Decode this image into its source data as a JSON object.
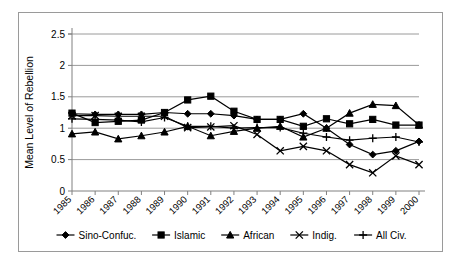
{
  "chart_data": {
    "type": "line",
    "title": "",
    "xlabel": "",
    "ylabel": "Mean Level of Rebellion",
    "ylim": [
      0,
      2.5
    ],
    "yticks": [
      0,
      0.5,
      1,
      1.5,
      2,
      2.5
    ],
    "ytick_labels": [
      "0",
      "0.5",
      "1",
      "1.5",
      "2",
      "2.5"
    ],
    "grid": "horizontal",
    "legend_position": "bottom",
    "categories": [
      "1985",
      "1986",
      "1987",
      "1988",
      "1989",
      "1990",
      "1991",
      "1992",
      "1993",
      "1994",
      "1995",
      "1996",
      "1997",
      "1998",
      "1999",
      "2000"
    ],
    "series": [
      {
        "name": "Sino-Confuc.",
        "marker": "diamond",
        "values": [
          1.23,
          1.22,
          1.22,
          1.22,
          1.25,
          1.23,
          1.23,
          1.2,
          1.14,
          1.14,
          1.23,
          1.0,
          0.74,
          0.58,
          0.64,
          0.79
        ]
      },
      {
        "name": "Islamic",
        "marker": "square",
        "values": [
          1.24,
          1.09,
          1.11,
          1.13,
          1.25,
          1.45,
          1.51,
          1.27,
          1.14,
          1.14,
          1.03,
          1.15,
          1.07,
          1.14,
          1.05,
          1.05
        ]
      },
      {
        "name": "African",
        "marker": "triangle",
        "values": [
          0.91,
          0.94,
          0.83,
          0.88,
          0.94,
          1.03,
          0.88,
          0.95,
          1.0,
          1.03,
          0.86,
          1.0,
          1.24,
          1.38,
          1.36,
          1.05
        ]
      },
      {
        "name": "Indig.",
        "marker": "cross-x",
        "values": [
          1.2,
          1.2,
          1.19,
          1.19,
          1.19,
          1.01,
          1.02,
          1.04,
          0.9,
          0.64,
          0.71,
          0.64,
          0.42,
          0.29,
          0.56,
          0.42
        ]
      },
      {
        "name": "All Civ.",
        "marker": "plus",
        "values": [
          1.15,
          1.14,
          1.13,
          1.1,
          1.17,
          1.03,
          1.03,
          1.0,
          1.01,
          1.01,
          0.92,
          0.86,
          0.81,
          0.84,
          0.86,
          0.78
        ]
      }
    ]
  },
  "legend": {
    "items": [
      {
        "label": "Sino-Confuc.",
        "marker": "diamond"
      },
      {
        "label": "Islamic",
        "marker": "square"
      },
      {
        "label": "African",
        "marker": "triangle"
      },
      {
        "label": "Indig.",
        "marker": "cross-x"
      },
      {
        "label": "All Civ.",
        "marker": "plus"
      }
    ]
  },
  "colors": {
    "line": "#000000",
    "grid": "#9a9a9a",
    "axis": "#808080",
    "border": "#9a9a9a",
    "background": "#ffffff"
  }
}
